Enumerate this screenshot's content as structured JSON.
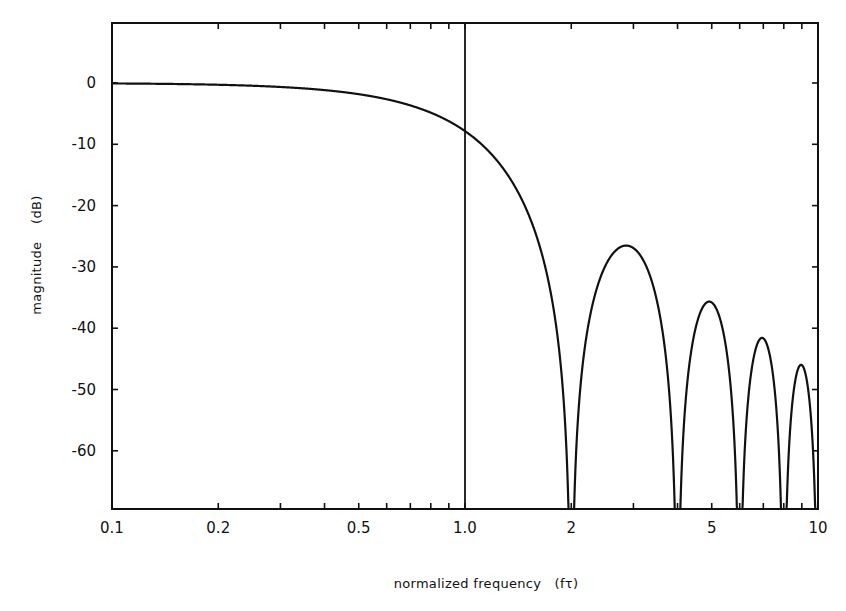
{
  "chart_data": {
    "type": "line",
    "title": "",
    "xlabel": "normalized frequency (fτ)",
    "ylabel": "magnitude (dB)",
    "xscale": "log",
    "xlim": [
      0.1,
      10
    ],
    "ylim": [
      -70,
      10
    ],
    "grid": false,
    "legend": null,
    "x_ticks": [
      0.1,
      0.2,
      0.5,
      1.0,
      2,
      5,
      10
    ],
    "x_tick_labels": [
      "0.1",
      "0.2",
      "0.5",
      "1.0",
      "2",
      "5",
      "10"
    ],
    "x_minor_ticks": [
      0.3,
      0.4,
      0.6,
      0.7,
      0.8,
      0.9,
      3,
      4,
      6,
      7,
      8,
      9
    ],
    "y_ticks": [
      0,
      -10,
      -20,
      -30,
      -40,
      -50,
      -60
    ],
    "y_tick_labels": [
      "0",
      "-10",
      "-20",
      "-30",
      "-40",
      "-50",
      "-60"
    ],
    "annotations": [
      {
        "type": "vline",
        "x": 1.0,
        "label": ""
      }
    ],
    "series": [
      {
        "name": "magnitude response",
        "description": "sinc^2(fτ/2) in dB; nulls at fτ = 2, 4, 6, 8, 10",
        "key_points": [
          {
            "x": 0.1,
            "y": 0.0
          },
          {
            "x": 0.5,
            "y": -1.8
          },
          {
            "x": 1.0,
            "y": -7.8
          },
          {
            "x": 2.0,
            "y": -70
          },
          {
            "x": 2.86,
            "y": -26.5
          },
          {
            "x": 4.0,
            "y": -70
          },
          {
            "x": 4.92,
            "y": -35.6
          },
          {
            "x": 6.0,
            "y": -70
          },
          {
            "x": 6.94,
            "y": -41.3
          },
          {
            "x": 8.0,
            "y": -70
          },
          {
            "x": 8.95,
            "y": -45.5
          },
          {
            "x": 10.0,
            "y": -70
          }
        ]
      }
    ]
  },
  "labels": {
    "xlabel": "normalized frequency   (fτ)",
    "ylabel": "magnitude    (dB)"
  },
  "style": {
    "line_color": "#111111",
    "axis_color": "#111111",
    "background": "#ffffff"
  }
}
